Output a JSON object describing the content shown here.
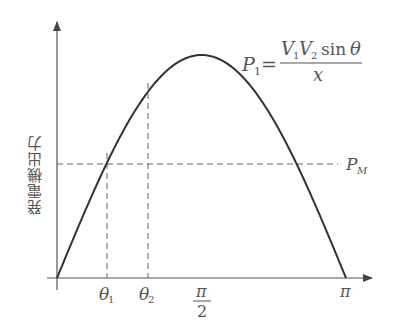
{
  "chart_data": {
    "type": "line",
    "title": "",
    "xlabel": "",
    "ylabel": "発電機出力",
    "function": "P1 = V1 V2 sin(theta) / x",
    "x_ticks": [
      "θ1",
      "θ2",
      "π/2",
      "π"
    ],
    "xlim": [
      0,
      3.1416
    ],
    "ylim": [
      0,
      1.0
    ],
    "series": [
      {
        "name": "P1",
        "x": [
          0,
          0.3927,
          0.7854,
          1.1781,
          1.5708,
          1.9635,
          2.3562,
          2.7489,
          3.1416
        ],
        "values": [
          0,
          0.383,
          0.707,
          0.924,
          1.0,
          0.924,
          0.707,
          0.383,
          0
        ]
      }
    ],
    "annotations": {
      "PM_level": 0.5,
      "theta1": 0.5236,
      "theta2": 0.95
    },
    "grid": false,
    "legend": "none"
  },
  "labels": {
    "ylabel": "発電機出力",
    "formula": {
      "lhs_P": "P",
      "lhs_sub": "1",
      "eq": "=",
      "num_V1": "V",
      "num_V1_sub": "1",
      "num_V2": "V",
      "num_V2_sub": "2",
      "num_sin": "sin",
      "num_theta": "θ",
      "den": "x"
    },
    "pm": {
      "P": "P",
      "sub": "M"
    },
    "theta1": {
      "sym": "θ",
      "sub": "1"
    },
    "theta2": {
      "sym": "θ",
      "sub": "2"
    },
    "half_pi": {
      "num": "π",
      "den": "2"
    },
    "pi": "π"
  }
}
